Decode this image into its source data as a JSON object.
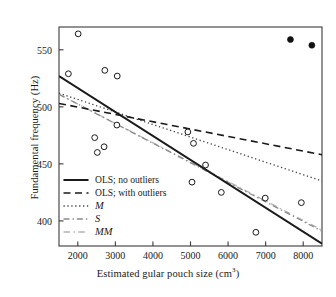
{
  "chart_data": {
    "type": "scatter",
    "title": "",
    "xlabel": "Estimated gular pouch size (cm3)",
    "xlabel_main": "Estimated gular pouch size (cm",
    "xlabel_sup": "3",
    "xlabel_tail": ")",
    "ylabel": "Fundamental frequency (Hz)",
    "xlim": [
      1500,
      8500
    ],
    "ylim": [
      378,
      570
    ],
    "xticks": [
      2000,
      3000,
      4000,
      5000,
      6000,
      7000,
      8000
    ],
    "xtick_labels": [
      "2000",
      "3000",
      "4000",
      "5000",
      "6000",
      "7000",
      "8000"
    ],
    "yticks": [
      400,
      450,
      500,
      550
    ],
    "ytick_labels": [
      "400",
      "450",
      "500",
      "550"
    ],
    "grid": false,
    "legend_position": "lower-left-inside",
    "series": [
      {
        "name": "data (non-outliers)",
        "marker": "open-circle",
        "color": "#1a1a1a",
        "points": [
          {
            "x": 2010,
            "y": 564
          },
          {
            "x": 1750,
            "y": 529
          },
          {
            "x": 2720,
            "y": 532
          },
          {
            "x": 3050,
            "y": 527
          },
          {
            "x": 3040,
            "y": 484
          },
          {
            "x": 2450,
            "y": 473
          },
          {
            "x": 2700,
            "y": 465
          },
          {
            "x": 2520,
            "y": 460
          },
          {
            "x": 4930,
            "y": 478
          },
          {
            "x": 5080,
            "y": 468
          },
          {
            "x": 5400,
            "y": 449
          },
          {
            "x": 5040,
            "y": 434
          },
          {
            "x": 5820,
            "y": 425
          },
          {
            "x": 6990,
            "y": 420
          },
          {
            "x": 7950,
            "y": 416
          },
          {
            "x": 6740,
            "y": 390
          }
        ]
      },
      {
        "name": "outliers",
        "marker": "filled-circle",
        "color": "#111111",
        "points": [
          {
            "x": 7660,
            "y": 559
          },
          {
            "x": 8230,
            "y": 554
          }
        ]
      }
    ],
    "fit_lines": [
      {
        "name": "OLS; no outliers",
        "style": "solid",
        "color": "#1a1a1a",
        "width": 2.0,
        "endpoints": [
          {
            "x": 1500,
            "y": 527
          },
          {
            "x": 8500,
            "y": 380
          }
        ]
      },
      {
        "name": "OLS; with outliers",
        "style": "dashed",
        "color": "#1a1a1a",
        "width": 1.6,
        "endpoints": [
          {
            "x": 1500,
            "y": 503
          },
          {
            "x": 8500,
            "y": 458
          }
        ]
      },
      {
        "name": "M",
        "style": "dotted",
        "color": "#444444",
        "width": 1.3,
        "endpoints": [
          {
            "x": 1500,
            "y": 512
          },
          {
            "x": 8500,
            "y": 435
          }
        ]
      },
      {
        "name": "S",
        "style": "dash-dot",
        "color": "#8a8a8a",
        "width": 1.3,
        "endpoints": [
          {
            "x": 1500,
            "y": 511
          },
          {
            "x": 8500,
            "y": 391
          }
        ]
      },
      {
        "name": "MM",
        "style": "dash-dot-light",
        "color": "#b3b3b3",
        "width": 1.3,
        "endpoints": [
          {
            "x": 1500,
            "y": 511
          },
          {
            "x": 8500,
            "y": 392
          }
        ]
      }
    ]
  },
  "legend": {
    "items": [
      {
        "label": "OLS; no outliers",
        "style": "solid",
        "italic": false
      },
      {
        "label": "OLS; with outliers",
        "style": "dashed",
        "italic": false
      },
      {
        "label": "M",
        "style": "dotted",
        "italic": true
      },
      {
        "label": "S",
        "style": "dash-dot",
        "italic": true
      },
      {
        "label": "MM",
        "style": "dash-dot-light",
        "italic": true
      }
    ]
  },
  "colors": {
    "axis": "#3a3a3a",
    "text": "#1a1a1a",
    "marker_edge": "#1a1a1a",
    "outlier_fill": "#111111",
    "line_m": "#444444",
    "line_s": "#8a8a8a",
    "line_mm": "#b3b3b3"
  }
}
